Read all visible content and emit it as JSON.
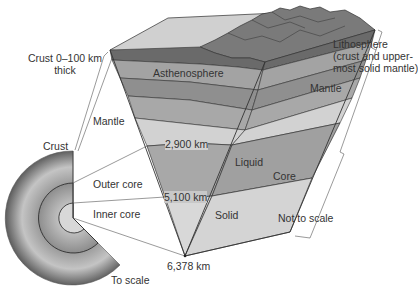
{
  "diagram": {
    "scale_notes": {
      "sphere": "To scale",
      "wedge": "Not to scale"
    },
    "sphere_labels": {
      "crust_thickness_line1": "Crust 0–100 km",
      "crust_thickness_line2": "thick",
      "crust": "Crust",
      "mantle": "Mantle",
      "outer_core": "Outer core",
      "inner_core": "Inner core"
    },
    "wedge_labels": {
      "asthenosphere": "Asthenosphere",
      "liquid": "Liquid",
      "solid": "Solid"
    },
    "right_labels": {
      "lithosphere_line1": "Lithosphere",
      "lithosphere_line2": "(crust and upper-",
      "lithosphere_line3": "most solid mantle)",
      "mantle": "Mantle",
      "core": "Core"
    },
    "depths": {
      "core_mantle_boundary": "2,900 km",
      "inner_outer_core_boundary": "5,100 km",
      "center": "6,378 km"
    },
    "colors": {
      "background": "#ffffff",
      "line": "#333333",
      "lithosphere_dark": "#6e6e6e",
      "asthenosphere": "#8f8f8f",
      "lower_mantle_band": "#a9a9a9",
      "lower_mantle_light": "#d3d3d3",
      "outer_core": "#a8a8a8",
      "inner_core": "#d9d9d9",
      "mountains": "#7a7a7a",
      "top_surface": "#cfcfcf"
    }
  }
}
